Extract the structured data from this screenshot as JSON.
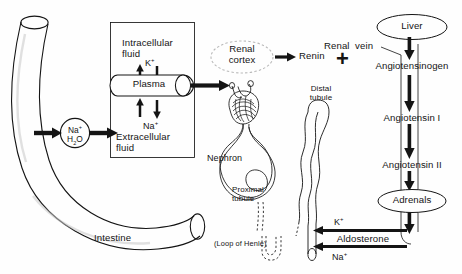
{
  "diagram": {
    "colors": {
      "ink": "#141414",
      "paper": "#fefefe",
      "faint": "#b9b9b9"
    }
  },
  "intestine": {
    "label": "Intestine",
    "icon": "curved-tube-icon"
  },
  "uptake": {
    "sodium": "Na",
    "sodium_charge": "+",
    "water": "H",
    "water_sub": "2",
    "water_o": "O"
  },
  "compartment_box": {
    "intracellular": {
      "line1": "Intracellular",
      "line2": "fluid"
    },
    "plasma": "Plasma",
    "extracellular": {
      "ion": "Na",
      "ion_charge": "+",
      "line1": "Extracellular",
      "line2": "fluid"
    },
    "potassium": {
      "ion": "K",
      "charge": "+"
    }
  },
  "renal_cortex": {
    "line1": "Renal",
    "line2": "cortex"
  },
  "renin": {
    "label": "Renin"
  },
  "plus": {
    "glyph": "+"
  },
  "nephron": {
    "label": "Nephron",
    "proximal": {
      "line1": "Proximal",
      "line2": "tubule"
    },
    "distal": {
      "line1": "Distal",
      "line2": "tubule"
    },
    "loop": "(Loop of Henle)"
  },
  "renal_vein": {
    "label": "Renal  vein"
  },
  "cascade": {
    "liver": "Liver",
    "angiotensinogen": "Angiotensinogen",
    "angiotensin_i": "Angiotensin I",
    "angiotensin_ii": "Angiotensin II",
    "adrenals": "Adrenals",
    "aldosterone": "Aldosterone"
  },
  "exchange": {
    "potassium": {
      "ion": "K",
      "charge": "+"
    },
    "sodium": {
      "ion": "Na",
      "charge": "+"
    }
  }
}
